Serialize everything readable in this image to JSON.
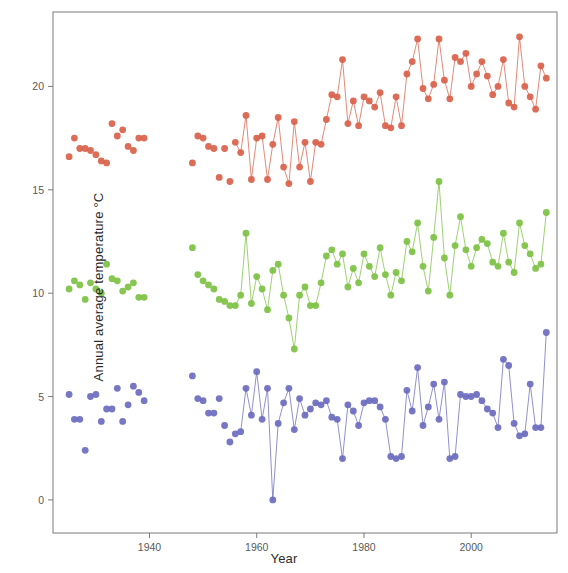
{
  "chart_data": {
    "type": "scatter",
    "title": "",
    "xlabel": "Year",
    "ylabel": "Annual average temperature °C",
    "xlim": [
      1922,
      2016
    ],
    "ylim": [
      -1.6,
      23.6
    ],
    "xticks": [
      1940,
      1960,
      1980,
      2000
    ],
    "xticklabels": [
      "1940",
      "1960",
      "1980",
      "2000"
    ],
    "yticks": [
      0,
      5,
      10,
      15,
      20
    ],
    "yticklabels": [
      "0",
      "5",
      "10",
      "15",
      "20"
    ],
    "grid": false,
    "legend": "none",
    "marker_size": 3.4,
    "series": [
      {
        "name": "maximum-temperature",
        "color": "#d9614a",
        "connected_from": 1956,
        "x": [
          1925,
          1926,
          1927,
          1928,
          1929,
          1930,
          1931,
          1932,
          1933,
          1934,
          1935,
          1936,
          1937,
          1938,
          1939,
          1948,
          1949,
          1950,
          1951,
          1952,
          1953,
          1954,
          1955,
          1956,
          1957,
          1958,
          1959,
          1960,
          1961,
          1962,
          1963,
          1964,
          1965,
          1966,
          1967,
          1968,
          1969,
          1970,
          1971,
          1972,
          1973,
          1974,
          1975,
          1976,
          1977,
          1978,
          1979,
          1980,
          1981,
          1982,
          1983,
          1984,
          1985,
          1986,
          1987,
          1988,
          1989,
          1990,
          1991,
          1992,
          1993,
          1994,
          1995,
          1996,
          1997,
          1998,
          1999,
          2000,
          2001,
          2002,
          2003,
          2004,
          2005,
          2006,
          2007,
          2008,
          2009,
          2010,
          2011,
          2012,
          2013,
          2014
        ],
        "y": [
          16.6,
          17.5,
          17.0,
          17.0,
          16.9,
          16.7,
          16.4,
          16.3,
          18.2,
          17.6,
          17.9,
          17.1,
          16.9,
          17.5,
          17.5,
          16.3,
          17.6,
          17.5,
          17.1,
          17.0,
          15.6,
          17.0,
          15.4,
          17.3,
          16.8,
          18.6,
          15.5,
          17.5,
          17.6,
          15.5,
          17.2,
          18.5,
          16.1,
          15.3,
          18.3,
          16.1,
          17.3,
          15.4,
          17.3,
          17.2,
          18.4,
          19.6,
          19.5,
          21.3,
          18.2,
          19.3,
          18.1,
          19.5,
          19.3,
          19.0,
          19.7,
          18.1,
          18.0,
          19.5,
          18.1,
          20.6,
          21.2,
          22.3,
          19.9,
          19.4,
          20.1,
          22.3,
          20.3,
          19.4,
          21.4,
          21.2,
          21.6,
          20.0,
          20.6,
          21.2,
          20.5,
          19.6,
          20.0,
          21.3,
          19.2,
          19.0,
          22.4,
          20.0,
          19.5,
          18.9,
          21.0,
          20.4
        ]
      },
      {
        "name": "mean-temperature",
        "color": "#7dc143",
        "connected_from": 1956,
        "x": [
          1925,
          1926,
          1927,
          1928,
          1929,
          1930,
          1931,
          1932,
          1933,
          1934,
          1935,
          1936,
          1937,
          1938,
          1939,
          1948,
          1949,
          1950,
          1951,
          1952,
          1953,
          1954,
          1955,
          1956,
          1957,
          1958,
          1959,
          1960,
          1961,
          1962,
          1963,
          1964,
          1965,
          1966,
          1967,
          1968,
          1969,
          1970,
          1971,
          1972,
          1973,
          1974,
          1975,
          1976,
          1977,
          1978,
          1979,
          1980,
          1981,
          1982,
          1983,
          1984,
          1985,
          1986,
          1987,
          1988,
          1989,
          1990,
          1991,
          1992,
          1993,
          1994,
          1995,
          1996,
          1997,
          1998,
          1999,
          2000,
          2001,
          2002,
          2003,
          2004,
          2005,
          2006,
          2007,
          2008,
          2009,
          2010,
          2011,
          2012,
          2013,
          2014
        ],
        "y": [
          10.2,
          10.6,
          10.4,
          9.7,
          10.5,
          10.2,
          10.0,
          11.4,
          10.7,
          10.6,
          10.1,
          10.3,
          10.5,
          9.8,
          9.8,
          12.2,
          10.9,
          10.6,
          10.4,
          10.2,
          9.7,
          9.6,
          9.4,
          9.4,
          9.9,
          12.9,
          9.5,
          10.8,
          10.2,
          9.2,
          11.1,
          11.4,
          9.9,
          8.8,
          7.3,
          9.9,
          10.3,
          9.4,
          9.4,
          10.5,
          11.8,
          12.1,
          11.4,
          11.9,
          10.3,
          11.2,
          10.5,
          11.9,
          11.3,
          10.8,
          12.2,
          10.9,
          9.9,
          11.0,
          10.6,
          12.5,
          12.0,
          13.4,
          11.3,
          10.1,
          12.7,
          15.4,
          11.7,
          9.9,
          12.3,
          13.7,
          12.1,
          11.3,
          12.2,
          12.6,
          12.4,
          11.5,
          11.3,
          12.9,
          11.5,
          11.0,
          13.4,
          12.3,
          11.9,
          11.2,
          11.4,
          13.9
        ]
      },
      {
        "name": "minimum-temperature",
        "color": "#6b6bbf",
        "connected_from": 1957,
        "x": [
          1925,
          1926,
          1927,
          1928,
          1929,
          1930,
          1931,
          1932,
          1933,
          1934,
          1935,
          1936,
          1937,
          1938,
          1939,
          1948,
          1949,
          1950,
          1951,
          1952,
          1953,
          1954,
          1955,
          1956,
          1957,
          1958,
          1959,
          1960,
          1961,
          1962,
          1963,
          1964,
          1965,
          1966,
          1967,
          1968,
          1969,
          1970,
          1971,
          1972,
          1973,
          1974,
          1975,
          1976,
          1977,
          1978,
          1979,
          1980,
          1981,
          1982,
          1983,
          1984,
          1985,
          1986,
          1987,
          1988,
          1989,
          1990,
          1991,
          1992,
          1993,
          1994,
          1995,
          1996,
          1997,
          1998,
          1999,
          2000,
          2001,
          2002,
          2003,
          2004,
          2005,
          2006,
          2007,
          2008,
          2009,
          2010,
          2011,
          2012,
          2013,
          2014
        ],
        "y": [
          5.1,
          3.9,
          3.9,
          2.4,
          5.0,
          5.1,
          3.8,
          4.4,
          4.4,
          5.4,
          3.8,
          4.6,
          5.5,
          5.2,
          4.8,
          6.0,
          4.9,
          4.8,
          4.2,
          4.2,
          4.9,
          3.6,
          2.8,
          3.2,
          3.3,
          5.4,
          4.1,
          6.2,
          3.9,
          5.4,
          0.0,
          3.7,
          4.7,
          5.4,
          3.4,
          4.9,
          4.1,
          4.4,
          4.7,
          4.6,
          4.8,
          4.0,
          3.9,
          2.0,
          4.6,
          4.3,
          3.6,
          4.7,
          4.8,
          4.8,
          4.5,
          3.9,
          2.1,
          2.0,
          2.1,
          5.3,
          4.3,
          6.4,
          3.6,
          4.5,
          5.6,
          3.9,
          5.7,
          2.0,
          2.1,
          5.1,
          5.0,
          5.0,
          5.1,
          4.8,
          4.4,
          4.2,
          3.5,
          6.8,
          6.5,
          3.7,
          3.1,
          3.2,
          5.6,
          3.5,
          3.5,
          8.1
        ]
      }
    ]
  },
  "axes": {
    "x_title": "Year",
    "y_title": "Annual average temperature °C"
  },
  "colors": {
    "series_max": "#d9614a",
    "series_mean": "#7dc143",
    "series_min": "#6b6bbf",
    "axis": "#7a7a7a",
    "tick_label": "#5a5a5a"
  }
}
